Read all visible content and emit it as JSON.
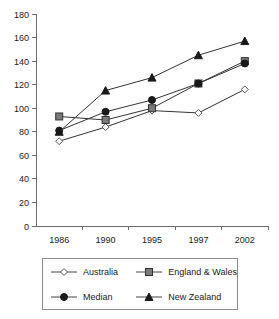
{
  "chart_data": {
    "type": "line",
    "title": "",
    "subtitle": "",
    "xlabel": "",
    "ylabel": "",
    "categories": [
      "1986",
      "1990",
      "1995",
      "1997",
      "2002"
    ],
    "ylim": [
      0,
      180
    ],
    "ytick_step": 20,
    "yticks": [
      "0",
      "20",
      "40",
      "60",
      "80",
      "100",
      "120",
      "140",
      "160",
      "180"
    ],
    "grid": false,
    "legend_position": "bottom",
    "series": [
      {
        "name": "Australia",
        "marker": "open-diamond",
        "marker_fill": "#ffffff",
        "marker_stroke": "#555555",
        "line_color": "#8a8a8a",
        "values": [
          72,
          84,
          98,
          96,
          116
        ]
      },
      {
        "name": "England & Wales",
        "marker": "square",
        "marker_fill": "#7a7a7a",
        "marker_stroke": "#333333",
        "line_color": "#555555",
        "values": [
          93,
          90,
          100,
          121,
          140
        ]
      },
      {
        "name": "Median",
        "marker": "filled-circle",
        "marker_fill": "#1a1a1a",
        "marker_stroke": "#1a1a1a",
        "line_color": "#333333",
        "values": [
          81,
          97,
          107,
          121,
          138
        ]
      },
      {
        "name": "New Zealand",
        "marker": "filled-triangle",
        "marker_fill": "#1a1a1a",
        "marker_stroke": "#1a1a1a",
        "line_color": "#333333",
        "values": [
          80,
          115,
          126,
          145,
          157
        ]
      }
    ]
  },
  "legend": {
    "entries": [
      {
        "label": "Australia",
        "marker": "open-diamond"
      },
      {
        "label": "England & Wales",
        "marker": "square"
      },
      {
        "label": "Median",
        "marker": "filled-circle"
      },
      {
        "label": "New Zealand",
        "marker": "filled-triangle"
      }
    ]
  }
}
